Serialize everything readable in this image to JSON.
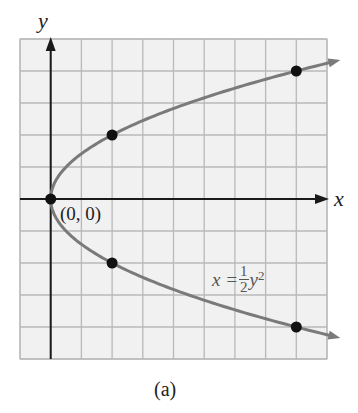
{
  "figure": {
    "caption": "(a)",
    "x_axis_label": "x",
    "y_axis_label": "y",
    "origin_label": "(0, 0)",
    "equation_label": {
      "lhs": "x =",
      "numerator": "1",
      "denominator": "2",
      "rhs": "y",
      "exponent": "2"
    }
  },
  "colors": {
    "curve": "#7a7a7a",
    "grid": "#b9b9b9",
    "grid_bg": "#f1f1f1",
    "axis": "#1a1a1a",
    "point": "#111111"
  },
  "chart_data": {
    "type": "line",
    "title": "",
    "xlabel": "x",
    "ylabel": "y",
    "equation": "x = (1/2) y^2",
    "grid": true,
    "grid_step": 1,
    "xlim": [
      -1,
      9
    ],
    "ylim": [
      -5,
      5
    ],
    "series": [
      {
        "name": "x = 1/2 y^2",
        "kind": "curve",
        "x": [
          9.24,
          8,
          4.5,
          2,
          0.5,
          0,
          0.5,
          2,
          4.5,
          8,
          9.24
        ],
        "y": [
          4.3,
          4,
          3,
          2,
          1,
          0,
          -1,
          -2,
          -3,
          -4,
          -4.3
        ]
      },
      {
        "name": "marked points",
        "kind": "points",
        "x": [
          0,
          2,
          8,
          2,
          8
        ],
        "y": [
          0,
          2,
          4,
          -2,
          -4
        ]
      }
    ],
    "annotations": [
      {
        "text": "(0, 0)",
        "x": 0,
        "y": 0
      },
      {
        "text": "x = 1/2 y^2",
        "x": 6.2,
        "y": -2.5
      }
    ]
  }
}
